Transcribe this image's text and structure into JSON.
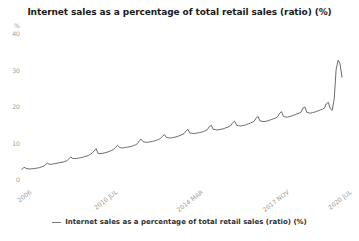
{
  "title": "Internet sales as a percentage of total retail sales (ratio) (%)",
  "legend": {
    "label": "Internet sales as a percentage of total retail sales (ratio) (%)"
  },
  "chart_data": {
    "type": "line",
    "title": "Internet sales as a percentage of total retail sales (ratio) (%)",
    "ylabel": "%",
    "ylim": [
      0,
      40
    ],
    "y_ticks": [
      0,
      10,
      20,
      30,
      40
    ],
    "grid": false,
    "legend_position": "bottom",
    "line_color": "#6b6b6b",
    "axis_text_color": "#9b9b9b",
    "x_tick_labels": [
      {
        "index": 0,
        "label": "2006"
      },
      {
        "index": 44,
        "label": "2010 JUL"
      },
      {
        "index": 88,
        "label": "2014 MAR"
      },
      {
        "index": 132,
        "label": "2017 NOV"
      },
      {
        "index": 164,
        "label": "2020 JUL"
      }
    ],
    "series": [
      {
        "name": "Internet sales as a percentage of total retail sales (ratio) (%)",
        "values": [
          2.9,
          3.5,
          3.2,
          3.1,
          3.0,
          3.1,
          3.1,
          3.2,
          3.3,
          3.4,
          3.6,
          3.8,
          4.2,
          4.6,
          4.3,
          4.3,
          4.4,
          4.5,
          4.6,
          4.7,
          4.8,
          4.9,
          5.1,
          5.3,
          5.8,
          6.3,
          5.9,
          5.9,
          5.9,
          6.0,
          6.1,
          6.2,
          6.4,
          6.5,
          6.7,
          7.0,
          7.4,
          8.0,
          8.6,
          7.3,
          7.2,
          7.3,
          7.4,
          7.5,
          7.7,
          7.9,
          8.1,
          8.4,
          9.0,
          9.5,
          8.9,
          8.8,
          8.8,
          8.9,
          9.0,
          9.1,
          9.2,
          9.4,
          9.6,
          9.9,
          10.6,
          11.2,
          10.5,
          10.4,
          10.3,
          10.4,
          10.5,
          10.6,
          10.7,
          10.9,
          11.1,
          11.4,
          12.0,
          12.4,
          11.7,
          11.6,
          11.5,
          11.6,
          11.7,
          11.8,
          12.0,
          12.2,
          12.4,
          12.7,
          13.4,
          13.9,
          12.9,
          12.8,
          12.7,
          12.8,
          12.9,
          13.0,
          13.1,
          13.3,
          13.5,
          13.8,
          14.6,
          15.0,
          13.9,
          13.8,
          13.7,
          13.8,
          13.9,
          14.0,
          14.2,
          14.4,
          14.6,
          14.9,
          15.7,
          16.1,
          15.0,
          14.9,
          14.8,
          14.9,
          15.0,
          15.2,
          15.4,
          15.6,
          15.8,
          16.1,
          17.0,
          17.4,
          16.2,
          16.1,
          16.0,
          16.1,
          16.2,
          16.4,
          16.6,
          16.8,
          17.0,
          17.3,
          18.3,
          18.7,
          17.4,
          17.3,
          17.2,
          17.4,
          17.5,
          17.7,
          17.9,
          18.1,
          18.3,
          18.6,
          19.7,
          20.0,
          18.5,
          18.4,
          18.3,
          18.5,
          18.6,
          18.8,
          19.0,
          19.2,
          19.4,
          19.7,
          20.9,
          21.3,
          19.5,
          19.1,
          22.2,
          30.2,
          32.8,
          31.9,
          28.2
        ]
      }
    ]
  }
}
